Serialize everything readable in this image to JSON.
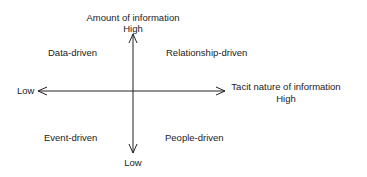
{
  "diagram": {
    "type": "quadrant",
    "y_axis": {
      "title": "Amount of information",
      "high_label": "High",
      "low_label": "Low"
    },
    "x_axis": {
      "title": "Tacit nature of information",
      "high_label": "High",
      "low_label": "Low"
    },
    "quadrants": {
      "top_left": "Data-driven",
      "top_right": "Relationship-driven",
      "bottom_left": "Event-driven",
      "bottom_right": "People-driven"
    },
    "line_color": "#222222"
  }
}
